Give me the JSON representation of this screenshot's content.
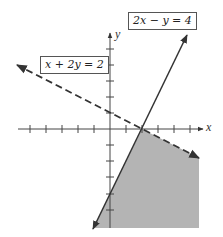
{
  "graph": {
    "type": "linear-inequality-system",
    "x_axis_label": "x",
    "y_axis_label": "y",
    "colors": {
      "shading": "#b4b4b4",
      "line": "#333333",
      "axis": "#444444"
    },
    "lines": [
      {
        "equation": "2x − y = 4",
        "style": "solid"
      },
      {
        "equation": "x + 2y = 2",
        "style": "dashed"
      }
    ],
    "intersection": "(2, 0)"
  }
}
